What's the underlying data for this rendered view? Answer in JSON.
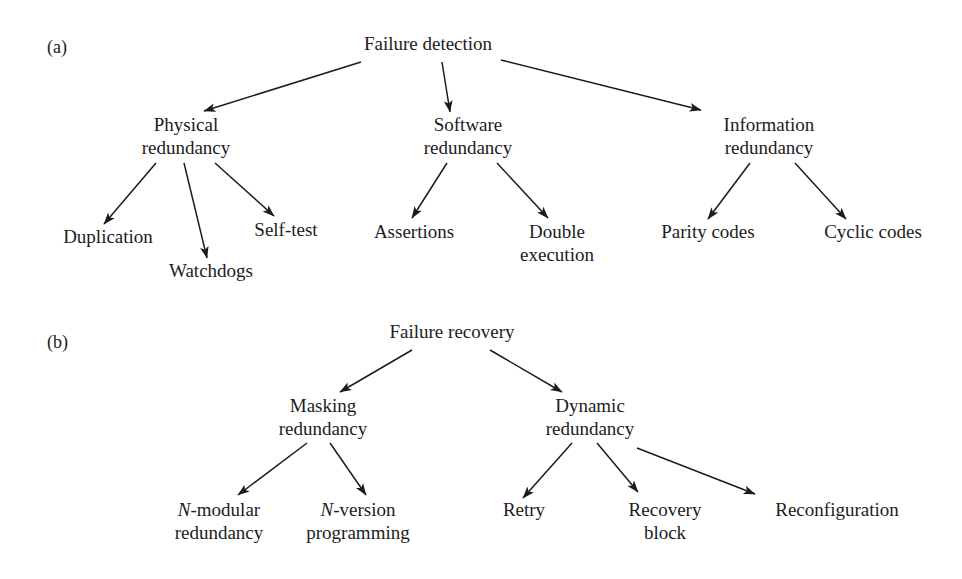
{
  "figure": {
    "background_color": "#ffffff",
    "ink_color": "#1c1c1c",
    "width": 962,
    "height": 579
  },
  "panels": [
    {
      "label": "(a)",
      "label_x": 47,
      "label_y": 53,
      "name": "panel-a-failure-detection",
      "root": "Failure detection",
      "nodes": [
        {
          "id": "a-root",
          "lines": [
            "Failure detection"
          ],
          "x": 428,
          "y": 50,
          "name": "node-failure-detection"
        },
        {
          "id": "a-phys",
          "lines": [
            "Physical",
            "redundancy"
          ],
          "x": 186,
          "y": 131,
          "name": "node-physical-redundancy"
        },
        {
          "id": "a-soft",
          "lines": [
            "Software",
            "redundancy"
          ],
          "x": 468,
          "y": 131,
          "name": "node-software-redundancy"
        },
        {
          "id": "a-info",
          "lines": [
            "Information",
            "redundancy"
          ],
          "x": 769,
          "y": 131,
          "name": "node-information-redundancy"
        },
        {
          "id": "a-dup",
          "lines": [
            "Duplication"
          ],
          "x": 108,
          "y": 243,
          "name": "node-duplication"
        },
        {
          "id": "a-watch",
          "lines": [
            "Watchdogs"
          ],
          "x": 211,
          "y": 277,
          "name": "node-watchdogs"
        },
        {
          "id": "a-self",
          "lines": [
            "Self-test"
          ],
          "x": 286,
          "y": 236,
          "name": "node-self-test"
        },
        {
          "id": "a-assert",
          "lines": [
            "Assertions"
          ],
          "x": 414,
          "y": 238,
          "name": "node-assertions"
        },
        {
          "id": "a-double",
          "lines": [
            "Double",
            "execution"
          ],
          "x": 557,
          "y": 238,
          "name": "node-double-execution"
        },
        {
          "id": "a-parity",
          "lines": [
            "Parity codes"
          ],
          "x": 708,
          "y": 238,
          "name": "node-parity-codes"
        },
        {
          "id": "a-cyclic",
          "lines": [
            "Cyclic codes"
          ],
          "x": 873,
          "y": 238,
          "name": "node-cyclic-codes"
        }
      ],
      "edges": [
        {
          "from": "Failure detection",
          "to": "Physical redundancy",
          "x1": 361,
          "y1": 62,
          "x2": 204,
          "y2": 111,
          "name": "edge-detection-to-physical"
        },
        {
          "from": "Failure detection",
          "to": "Software redundancy",
          "x1": 442,
          "y1": 62,
          "x2": 450,
          "y2": 112,
          "name": "edge-detection-to-software"
        },
        {
          "from": "Failure detection",
          "to": "Information redundancy",
          "x1": 501,
          "y1": 60,
          "x2": 701,
          "y2": 110,
          "name": "edge-detection-to-information"
        },
        {
          "from": "Physical redundancy",
          "to": "Duplication",
          "x1": 156,
          "y1": 163,
          "x2": 104,
          "y2": 224,
          "name": "edge-physical-to-duplication"
        },
        {
          "from": "Physical redundancy",
          "to": "Watchdogs",
          "x1": 184,
          "y1": 163,
          "x2": 207,
          "y2": 258,
          "name": "edge-physical-to-watchdogs"
        },
        {
          "from": "Physical redundancy",
          "to": "Self-test",
          "x1": 215,
          "y1": 163,
          "x2": 274,
          "y2": 216,
          "name": "edge-physical-to-self-test"
        },
        {
          "from": "Software redundancy",
          "to": "Assertions",
          "x1": 447,
          "y1": 163,
          "x2": 412,
          "y2": 218,
          "name": "edge-software-to-assertions"
        },
        {
          "from": "Software redundancy",
          "to": "Double execution",
          "x1": 497,
          "y1": 163,
          "x2": 548,
          "y2": 218,
          "name": "edge-software-to-double-execution"
        },
        {
          "from": "Information redundancy",
          "to": "Parity codes",
          "x1": 750,
          "y1": 163,
          "x2": 708,
          "y2": 219,
          "name": "edge-information-to-parity"
        },
        {
          "from": "Information redundancy",
          "to": "Cyclic codes",
          "x1": 795,
          "y1": 163,
          "x2": 846,
          "y2": 219,
          "name": "edge-information-to-cyclic"
        }
      ]
    },
    {
      "label": "(b)",
      "label_x": 47,
      "label_y": 348,
      "name": "panel-b-failure-recovery",
      "root": "Failure recovery",
      "nodes": [
        {
          "id": "b-root",
          "lines": [
            "Failure recovery"
          ],
          "x": 452,
          "y": 338,
          "name": "node-failure-recovery"
        },
        {
          "id": "b-mask",
          "lines": [
            "Masking",
            "redundancy"
          ],
          "x": 323,
          "y": 412,
          "name": "node-masking-redundancy"
        },
        {
          "id": "b-dyn",
          "lines": [
            "Dynamic",
            "redundancy"
          ],
          "x": 590,
          "y": 412,
          "name": "node-dynamic-redundancy"
        },
        {
          "id": "b-nmod",
          "lines": [
            "N-modular",
            "redundancy"
          ],
          "x": 219,
          "y": 516,
          "name": "node-n-modular-redundancy",
          "italic_prefix": "N"
        },
        {
          "id": "b-nver",
          "lines": [
            "N-version",
            "programming"
          ],
          "x": 358,
          "y": 516,
          "name": "node-n-version-programming",
          "italic_prefix": "N"
        },
        {
          "id": "b-retry",
          "lines": [
            "Retry"
          ],
          "x": 524,
          "y": 516,
          "name": "node-retry"
        },
        {
          "id": "b-recblk",
          "lines": [
            "Recovery",
            "block"
          ],
          "x": 665,
          "y": 516,
          "name": "node-recovery-block"
        },
        {
          "id": "b-recfg",
          "lines": [
            "Reconfiguration"
          ],
          "x": 837,
          "y": 516,
          "name": "node-reconfiguration"
        }
      ],
      "edges": [
        {
          "from": "Failure recovery",
          "to": "Masking redundancy",
          "x1": 412,
          "y1": 350,
          "x2": 340,
          "y2": 392,
          "name": "edge-recovery-to-masking"
        },
        {
          "from": "Failure recovery",
          "to": "Dynamic redundancy",
          "x1": 490,
          "y1": 350,
          "x2": 562,
          "y2": 392,
          "name": "edge-recovery-to-dynamic"
        },
        {
          "from": "Masking redundancy",
          "to": "N-modular redundancy",
          "x1": 307,
          "y1": 443,
          "x2": 238,
          "y2": 495,
          "name": "edge-masking-to-n-modular"
        },
        {
          "from": "Masking redundancy",
          "to": "N-version programming",
          "x1": 330,
          "y1": 443,
          "x2": 366,
          "y2": 495,
          "name": "edge-masking-to-n-version"
        },
        {
          "from": "Dynamic redundancy",
          "to": "Retry",
          "x1": 572,
          "y1": 443,
          "x2": 523,
          "y2": 498,
          "name": "edge-dynamic-to-retry"
        },
        {
          "from": "Dynamic redundancy",
          "to": "Recovery block",
          "x1": 597,
          "y1": 443,
          "x2": 638,
          "y2": 492,
          "name": "edge-dynamic-to-recovery-block"
        },
        {
          "from": "Dynamic redundancy",
          "to": "Reconfiguration",
          "x1": 637,
          "y1": 448,
          "x2": 755,
          "y2": 494,
          "name": "edge-dynamic-to-reconfiguration"
        }
      ]
    }
  ]
}
